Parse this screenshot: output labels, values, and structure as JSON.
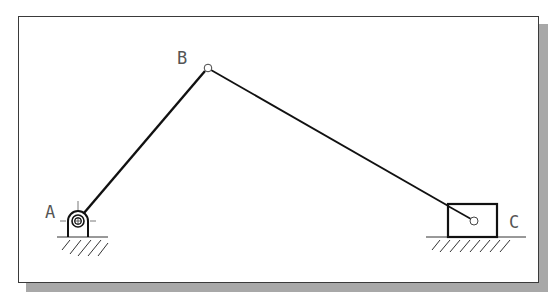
{
  "diagram": {
    "type": "slider-crank mechanism",
    "labels": {
      "A": "A",
      "B": "B",
      "C": "C"
    },
    "points": {
      "A": {
        "x": 78,
        "y": 221
      },
      "B": {
        "x": 208,
        "y": 68
      },
      "C": {
        "x": 474,
        "y": 221
      }
    },
    "links": [
      {
        "from": "A",
        "to": "B",
        "name": "crank"
      },
      {
        "from": "B",
        "to": "C",
        "name": "connecting-rod"
      }
    ],
    "colors": {
      "line": "#1a1a1a",
      "label": "#555555",
      "frame": "#3a3a3a",
      "shadow": "#a8a8a8"
    }
  }
}
